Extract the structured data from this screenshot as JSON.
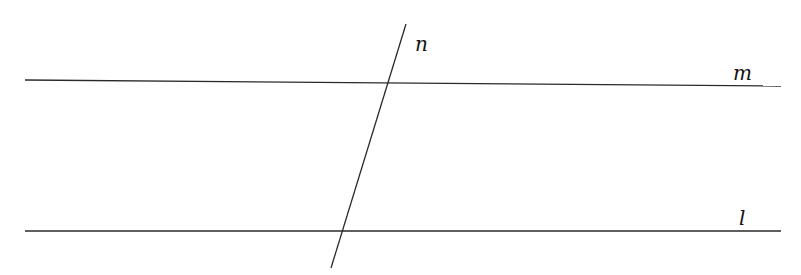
{
  "diagram": {
    "lines": [
      {
        "name": "m",
        "label": "m",
        "x1": 25,
        "y1": 80,
        "x2": 781,
        "y2": 86
      },
      {
        "name": "l",
        "label": "l",
        "x1": 25,
        "y1": 231,
        "x2": 781,
        "y2": 231
      },
      {
        "name": "n",
        "label": "n",
        "x1": 406,
        "y1": 24,
        "x2": 331,
        "y2": 268
      }
    ],
    "labels": {
      "n": {
        "text": "n",
        "x": 415,
        "y": 51
      },
      "m": {
        "text": "m",
        "x": 733,
        "y": 80
      },
      "l": {
        "text": "l",
        "x": 739,
        "y": 225
      }
    },
    "colors": {
      "line": "#2a2a2a",
      "label": "#111111",
      "background": "#ffffff"
    }
  }
}
